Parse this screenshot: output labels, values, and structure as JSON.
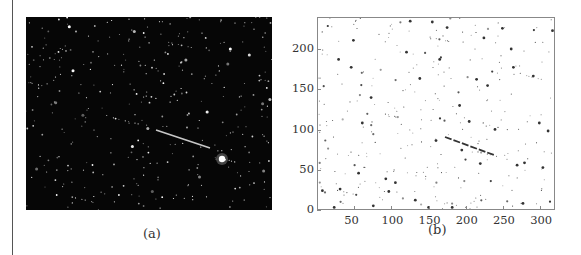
{
  "panel_a": {
    "caption": "(a)",
    "description": "star-field photograph with a bright linear streak",
    "background_color": "#060606",
    "star_color": "#ffffff"
  },
  "panel_b": {
    "caption": "(b)",
    "x_ticks": [
      "50",
      "100",
      "150",
      "200",
      "250",
      "300"
    ],
    "y_ticks": [
      "0",
      "50",
      "100",
      "150",
      "200"
    ]
  },
  "chart_data": {
    "type": "scatter",
    "title": "",
    "xlabel": "",
    "ylabel": "",
    "xlim": [
      0,
      320
    ],
    "ylim": [
      0,
      240
    ],
    "x_ticks": [
      50,
      100,
      150,
      200,
      250,
      300
    ],
    "y_ticks": [
      0,
      50,
      100,
      150,
      200
    ],
    "grid": false,
    "legend": null,
    "annotations": [
      "(b)"
    ],
    "series": [
      {
        "name": "streak",
        "x": [
          172,
          185,
          200,
          215,
          230,
          240
        ],
        "y": [
          98,
          94,
          88,
          83,
          78,
          74
        ]
      },
      {
        "name": "stars",
        "x": [
          6,
          22,
          28,
          30,
          45,
          48,
          55,
          60,
          72,
          75,
          92,
          96,
          105,
          120,
          125,
          132,
          138,
          150,
          155,
          160,
          165,
          175,
          182,
          192,
          195,
          205,
          215,
          220,
          225,
          230,
          240,
          250,
          262,
          265,
          270,
          278,
          280,
          292,
          300,
          305,
          312,
          318
        ],
        "y": [
          23,
          2,
          188,
          25,
          178,
          212,
          45,
          108,
          140,
          4,
          38,
          22,
          33,
          197,
          236,
          11,
          164,
          2,
          235,
          86,
          188,
          228,
          2,
          130,
          74,
          110,
          163,
          57,
          215,
          155,
          100,
          227,
          201,
          178,
          55,
          7,
          58,
          167,
          108,
          52,
          98,
          224
        ]
      }
    ]
  }
}
